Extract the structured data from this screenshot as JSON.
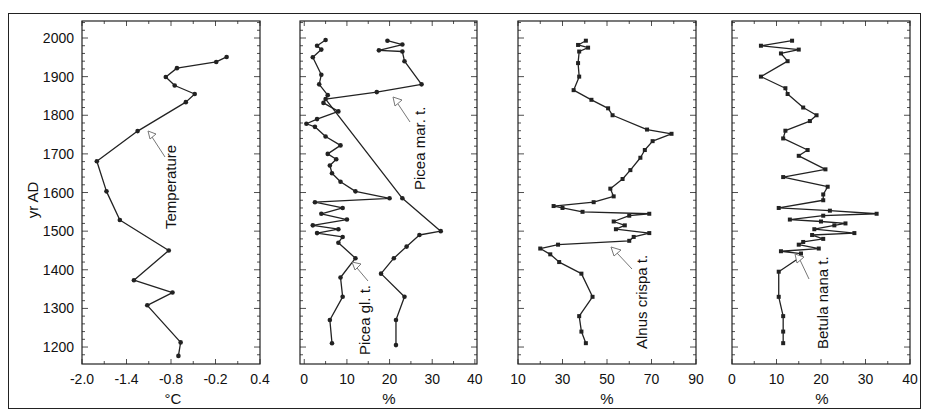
{
  "chart_data": [
    {
      "type": "line",
      "panel": 1,
      "title": "",
      "xlabel": "°C",
      "ylabel": "yr AD",
      "xlim": [
        -2.0,
        0.4
      ],
      "ylim": [
        1160,
        2040
      ],
      "xticks": [
        "-2.0",
        "-1.4",
        "-0.8",
        "-0.2",
        "0.4"
      ],
      "yticks": [
        "1200",
        "1300",
        "1400",
        "1500",
        "1600",
        "1700",
        "1800",
        "1900",
        "2000"
      ],
      "annotation": "Temperature",
      "series": [
        {
          "name": "Temperature",
          "marker": "circle",
          "points": [
            {
              "year": 1951,
              "value": -0.05
            },
            {
              "year": 1938,
              "value": -0.19
            },
            {
              "year": 1922,
              "value": -0.72
            },
            {
              "year": 1899,
              "value": -0.87
            },
            {
              "year": 1877,
              "value": -0.75
            },
            {
              "year": 1855,
              "value": -0.48
            },
            {
              "year": 1834,
              "value": -0.6
            },
            {
              "year": 1759,
              "value": -1.25
            },
            {
              "year": 1681,
              "value": -1.8
            },
            {
              "year": 1603,
              "value": -1.67
            },
            {
              "year": 1529,
              "value": -1.49
            },
            {
              "year": 1450,
              "value": -0.83
            },
            {
              "year": 1373,
              "value": -1.3
            },
            {
              "year": 1341,
              "value": -0.78
            },
            {
              "year": 1308,
              "value": -1.12
            },
            {
              "year": 1212,
              "value": -0.67
            },
            {
              "year": 1177,
              "value": -0.7
            }
          ]
        }
      ]
    },
    {
      "type": "line",
      "panel": 2,
      "xlabel": "%",
      "xlim": [
        -1,
        40
      ],
      "xticks": [
        "0",
        "10",
        "20",
        "30",
        "40"
      ],
      "annotations": [
        "Picea mar. t.",
        "Picea gl. t."
      ],
      "series": [
        {
          "name": "Picea mar. t.",
          "marker": "circle",
          "points": [
            {
              "year": 1993,
              "value": 19.5
            },
            {
              "year": 1983,
              "value": 23.0
            },
            {
              "year": 1968,
              "value": 17.5
            },
            {
              "year": 1965,
              "value": 23.0
            },
            {
              "year": 1940,
              "value": 23.5
            },
            {
              "year": 1880,
              "value": 27.5
            },
            {
              "year": 1860,
              "value": 17.0
            },
            {
              "year": 1842,
              "value": 5.0
            },
            {
              "year": 1585,
              "value": 23.0
            },
            {
              "year": 1500,
              "value": 32.0
            },
            {
              "year": 1490,
              "value": 27.0
            },
            {
              "year": 1460,
              "value": 24.0
            },
            {
              "year": 1430,
              "value": 21.0
            },
            {
              "year": 1390,
              "value": 18.0
            },
            {
              "year": 1330,
              "value": 23.5
            },
            {
              "year": 1270,
              "value": 21.5
            },
            {
              "year": 1205,
              "value": 21.5
            }
          ]
        },
        {
          "name": "Picea gl. t.",
          "marker": "circle",
          "points": [
            {
              "year": 1995,
              "value": 5.0
            },
            {
              "year": 1980,
              "value": 3.0
            },
            {
              "year": 1970,
              "value": 4.0
            },
            {
              "year": 1950,
              "value": 2.0
            },
            {
              "year": 1905,
              "value": 4.0
            },
            {
              "year": 1880,
              "value": 3.5
            },
            {
              "year": 1852,
              "value": 5.5
            },
            {
              "year": 1832,
              "value": 4.5
            },
            {
              "year": 1810,
              "value": 8.0
            },
            {
              "year": 1790,
              "value": 3.0
            },
            {
              "year": 1778,
              "value": 0.5
            },
            {
              "year": 1770,
              "value": 2.5
            },
            {
              "year": 1745,
              "value": 5.0
            },
            {
              "year": 1722,
              "value": 8.5
            },
            {
              "year": 1700,
              "value": 5.5
            },
            {
              "year": 1686,
              "value": 7.5
            },
            {
              "year": 1670,
              "value": 6.0
            },
            {
              "year": 1650,
              "value": 6.5
            },
            {
              "year": 1628,
              "value": 8.5
            },
            {
              "year": 1603,
              "value": 12.0
            },
            {
              "year": 1585,
              "value": 20.0
            },
            {
              "year": 1575,
              "value": 2.5
            },
            {
              "year": 1560,
              "value": 9.0
            },
            {
              "year": 1545,
              "value": 4.0
            },
            {
              "year": 1530,
              "value": 10.0
            },
            {
              "year": 1515,
              "value": 2.0
            },
            {
              "year": 1505,
              "value": 8.0
            },
            {
              "year": 1495,
              "value": 3.0
            },
            {
              "year": 1485,
              "value": 9.0
            },
            {
              "year": 1470,
              "value": 8.0
            },
            {
              "year": 1430,
              "value": 12.0
            },
            {
              "year": 1380,
              "value": 8.5
            },
            {
              "year": 1330,
              "value": 9.0
            },
            {
              "year": 1270,
              "value": 6.0
            },
            {
              "year": 1210,
              "value": 6.5
            }
          ]
        }
      ]
    },
    {
      "type": "line",
      "panel": 3,
      "xlabel": "%",
      "xlim": [
        10,
        90
      ],
      "xticks": [
        "10",
        "30",
        "50",
        "70",
        "90"
      ],
      "annotation": "Alnus crispa t.",
      "series": [
        {
          "name": "Alnus crispa t.",
          "marker": "square",
          "points": [
            {
              "year": 1993,
              "value": 40.5
            },
            {
              "year": 1982,
              "value": 37.0
            },
            {
              "year": 1975,
              "value": 41.5
            },
            {
              "year": 1965,
              "value": 37.5
            },
            {
              "year": 1935,
              "value": 37.0
            },
            {
              "year": 1900,
              "value": 37.5
            },
            {
              "year": 1865,
              "value": 35.0
            },
            {
              "year": 1840,
              "value": 43.0
            },
            {
              "year": 1818,
              "value": 50.5
            },
            {
              "year": 1800,
              "value": 52.5
            },
            {
              "year": 1763,
              "value": 68.0
            },
            {
              "year": 1752,
              "value": 79.0
            },
            {
              "year": 1733,
              "value": 70.5
            },
            {
              "year": 1710,
              "value": 67.0
            },
            {
              "year": 1690,
              "value": 65.0
            },
            {
              "year": 1658,
              "value": 60.5
            },
            {
              "year": 1635,
              "value": 57.0
            },
            {
              "year": 1610,
              "value": 51.5
            },
            {
              "year": 1590,
              "value": 53.0
            },
            {
              "year": 1575,
              "value": 44.0
            },
            {
              "year": 1565,
              "value": 26.0
            },
            {
              "year": 1560,
              "value": 30.0
            },
            {
              "year": 1550,
              "value": 39.0
            },
            {
              "year": 1545,
              "value": 69.0
            },
            {
              "year": 1540,
              "value": 60.0
            },
            {
              "year": 1525,
              "value": 53.0
            },
            {
              "year": 1515,
              "value": 58.0
            },
            {
              "year": 1505,
              "value": 54.0
            },
            {
              "year": 1495,
              "value": 69.0
            },
            {
              "year": 1485,
              "value": 62.0
            },
            {
              "year": 1475,
              "value": 60.0
            },
            {
              "year": 1465,
              "value": 28.0
            },
            {
              "year": 1455,
              "value": 20.0
            },
            {
              "year": 1440,
              "value": 24.5
            },
            {
              "year": 1420,
              "value": 28.5
            },
            {
              "year": 1390,
              "value": 38.5
            },
            {
              "year": 1330,
              "value": 43.5
            },
            {
              "year": 1280,
              "value": 37.5
            },
            {
              "year": 1240,
              "value": 38.5
            },
            {
              "year": 1210,
              "value": 40.5
            }
          ]
        }
      ]
    },
    {
      "type": "line",
      "panel": 4,
      "xlabel": "%",
      "xlim": [
        0,
        40
      ],
      "xticks": [
        "0",
        "10",
        "20",
        "30",
        "40"
      ],
      "annotation": "Betula nana t.",
      "series": [
        {
          "name": "Betula nana t.",
          "marker": "square",
          "points": [
            {
              "year": 1993,
              "value": 13.5
            },
            {
              "year": 1980,
              "value": 6.5
            },
            {
              "year": 1970,
              "value": 15.0
            },
            {
              "year": 1960,
              "value": 11.0
            },
            {
              "year": 1940,
              "value": 12.5
            },
            {
              "year": 1900,
              "value": 6.5
            },
            {
              "year": 1870,
              "value": 12.0
            },
            {
              "year": 1855,
              "value": 12.5
            },
            {
              "year": 1820,
              "value": 16.0
            },
            {
              "year": 1800,
              "value": 19.0
            },
            {
              "year": 1785,
              "value": 17.5
            },
            {
              "year": 1760,
              "value": 12.0
            },
            {
              "year": 1740,
              "value": 11.5
            },
            {
              "year": 1710,
              "value": 17.0
            },
            {
              "year": 1695,
              "value": 15.0
            },
            {
              "year": 1660,
              "value": 21.0
            },
            {
              "year": 1640,
              "value": 11.5
            },
            {
              "year": 1615,
              "value": 21.5
            },
            {
              "year": 1595,
              "value": 20.5
            },
            {
              "year": 1580,
              "value": 20.5
            },
            {
              "year": 1560,
              "value": 10.5
            },
            {
              "year": 1553,
              "value": 22.0
            },
            {
              "year": 1545,
              "value": 32.5
            },
            {
              "year": 1540,
              "value": 20.5
            },
            {
              "year": 1530,
              "value": 13.0
            },
            {
              "year": 1525,
              "value": 20.0
            },
            {
              "year": 1520,
              "value": 25.5
            },
            {
              "year": 1515,
              "value": 23.0
            },
            {
              "year": 1505,
              "value": 18.5
            },
            {
              "year": 1495,
              "value": 27.5
            },
            {
              "year": 1490,
              "value": 18.0
            },
            {
              "year": 1480,
              "value": 20.5
            },
            {
              "year": 1472,
              "value": 16.0
            },
            {
              "year": 1465,
              "value": 15.0
            },
            {
              "year": 1455,
              "value": 19.5
            },
            {
              "year": 1448,
              "value": 11.0
            },
            {
              "year": 1442,
              "value": 15.5
            },
            {
              "year": 1430,
              "value": 15.0
            },
            {
              "year": 1395,
              "value": 10.5
            },
            {
              "year": 1330,
              "value": 10.5
            },
            {
              "year": 1280,
              "value": 11.5
            },
            {
              "year": 1240,
              "value": 11.5
            },
            {
              "year": 1210,
              "value": 11.5
            }
          ]
        }
      ]
    }
  ],
  "labels": {
    "y_axis_title": "yr AD",
    "panel1_xlabel": "°C",
    "panel2_xlabel": "%",
    "panel3_xlabel": "%",
    "panel4_xlabel": "%",
    "temperature": "Temperature",
    "picea_mar": "Picea mar. t.",
    "picea_gl": "Picea gl. t.",
    "alnus": "Alnus crispa t.",
    "betula": "Betula nana t."
  },
  "colors": {
    "line": "#222222",
    "frame": "#222222",
    "arrow": "#777777",
    "background": "#ffffff"
  }
}
